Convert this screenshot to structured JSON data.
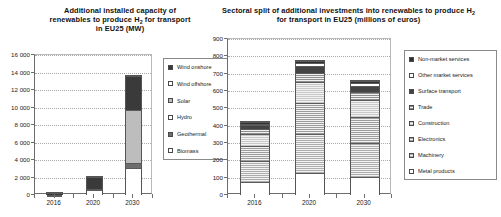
{
  "chart_data": [
    {
      "id": "capacity",
      "type": "bar",
      "subtype": "stacked",
      "title_lines": [
        "Additional installed capacity of",
        "renewables to produce H|2| for transport",
        "in EU25 (MW)"
      ],
      "title": "Additional installed capacity of renewables to produce H2 for transport in EU25 (MW)",
      "xlabel": "",
      "ylabel": "",
      "categories": [
        "2016",
        "2020",
        "2030"
      ],
      "ylim": [
        0,
        16000
      ],
      "ytick_step": 2000,
      "ytick_labels": [
        "0",
        "2 000",
        "4 000",
        "6 000",
        "8 000",
        "10 000",
        "12 000",
        "14 000",
        "16 000"
      ],
      "ytick_values": [
        0,
        2000,
        4000,
        6000,
        8000,
        10000,
        12000,
        14000,
        16000
      ],
      "grid": true,
      "legend_position": "right",
      "series": [
        {
          "name": "Wind onshore",
          "color": "#3a3a3a",
          "pattern": "solid",
          "values": [
            250,
            1350,
            3900
          ]
        },
        {
          "name": "Wind offshore",
          "color": "#ffffff",
          "pattern": "solid",
          "values": [
            0,
            0,
            0
          ]
        },
        {
          "name": "Solar",
          "color": "#bdbdbd",
          "pattern": "solid",
          "values": [
            20,
            40,
            6100
          ]
        },
        {
          "name": "Hydro",
          "color": "#ffffff",
          "pattern": "solid",
          "values": [
            0,
            0,
            0
          ]
        },
        {
          "name": "Geothermal",
          "color": "#6e6e6e",
          "pattern": "solid",
          "values": [
            30,
            60,
            550
          ]
        },
        {
          "name": "Biomass",
          "color": "#ffffff",
          "pattern": "solid",
          "values": [
            10,
            680,
            3200
          ]
        }
      ],
      "stack_order_bottom_to_top": [
        "Biomass",
        "Geothermal",
        "Solar",
        "Hydro",
        "Wind offshore",
        "Wind onshore"
      ],
      "totals": [
        310,
        2130,
        13750
      ]
    },
    {
      "id": "investments",
      "type": "bar",
      "subtype": "stacked",
      "title_lines": [
        "Sectoral split of additional investments into renewables to produce H|2|",
        "for transport in EU25 (millions of euros)"
      ],
      "title": "Sectoral split of additional investments into renewables to produce H2 for transport in EU25 (millions of euros)",
      "xlabel": "",
      "ylabel": "",
      "categories": [
        "2016",
        "2020",
        "2030"
      ],
      "ylim": [
        0,
        900
      ],
      "ytick_step": 100,
      "ytick_labels": [
        "0",
        "100",
        "200",
        "300",
        "400",
        "500",
        "600",
        "700",
        "800",
        "900"
      ],
      "ytick_values": [
        0,
        100,
        200,
        300,
        400,
        500,
        600,
        700,
        800,
        900
      ],
      "grid": true,
      "legend_position": "right",
      "series": [
        {
          "name": "Non-market services",
          "color": "#2f2f2f",
          "pattern": "solid",
          "values": [
            8,
            14,
            12
          ]
        },
        {
          "name": "Other market services",
          "color": "#ffffff",
          "pattern": "solid",
          "values": [
            10,
            16,
            14
          ]
        },
        {
          "name": "Surface transport",
          "color": "#444444",
          "pattern": "solid",
          "values": [
            22,
            44,
            38
          ]
        },
        {
          "name": "Trade",
          "color": "#8f8f8f",
          "pattern": "hatch",
          "values": [
            30,
            52,
            45
          ]
        },
        {
          "name": "Construction",
          "color": "#c8c8c8",
          "pattern": "hatch",
          "values": [
            65,
            120,
            100
          ]
        },
        {
          "name": "Electronics",
          "color": "#9d9d9d",
          "pattern": "hatch",
          "values": [
            90,
            175,
            148
          ]
        },
        {
          "name": "Machinery",
          "color": "#adadad",
          "pattern": "hatch",
          "values": [
            120,
            230,
            195
          ]
        },
        {
          "name": "Metal products",
          "color": "#ffffff",
          "pattern": "solid",
          "values": [
            80,
            130,
            110
          ]
        }
      ],
      "stack_order_bottom_to_top": [
        "Metal products",
        "Machinery",
        "Electronics",
        "Construction",
        "Trade",
        "Surface transport",
        "Other market services",
        "Non-market services"
      ],
      "totals": [
        425,
        781,
        662
      ]
    }
  ]
}
